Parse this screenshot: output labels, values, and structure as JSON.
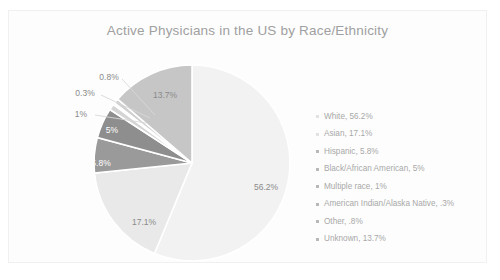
{
  "chart_data": {
    "type": "pie",
    "title": "Active Physicians in the US by Race/Ethnicity",
    "categories": [
      "White",
      "Asian",
      "Hispanic",
      "Black/African American",
      "Multiple race",
      "American Indian/Alaska Native",
      "Other",
      "Unknown"
    ],
    "values": [
      56.2,
      17.1,
      5.8,
      5,
      1,
      0.3,
      0.8,
      13.7
    ],
    "value_labels": [
      "56.2%",
      "17.1%",
      "5.8%",
      "5%",
      "1%",
      "0.3%",
      "0.8%",
      "13.7%"
    ],
    "legend_position": "right",
    "legend_entries": [
      "White, 56.2%",
      "Asian, 17.1%",
      "Hispanic, 5.8%",
      "Black/African American, 5%",
      "Multiple race, 1%",
      "American Indian/Alaska Native, .3%",
      "Other, .8%",
      "Unknown, 13.7%"
    ],
    "slice_colors": [
      "#f2f2f2",
      "#e9e9e9",
      "#9a9a9a",
      "#8e8e8e",
      "#d5d5d5",
      "#bdbdbd",
      "#cfcfcf",
      "#c6c6c6"
    ],
    "xlabel": "",
    "ylabel": "",
    "grid": false
  },
  "card": {
    "title": "Active Physicians in the US by Race/Ethnicity"
  },
  "pie_labels": [
    {
      "text": "13.7%",
      "x": 156,
      "y": 84,
      "style": "dark-text"
    },
    {
      "text": "0.8%",
      "x": 100,
      "y": 66,
      "style": "callout-text"
    },
    {
      "text": "0.3%",
      "x": 76,
      "y": 82,
      "style": "callout-text"
    },
    {
      "text": "1%",
      "x": 72,
      "y": 103,
      "style": "callout-text"
    },
    {
      "text": "5%",
      "x": 103,
      "y": 119,
      "style": "light-text"
    },
    {
      "text": "5.8%",
      "x": 92,
      "y": 152,
      "style": "light-text"
    },
    {
      "text": "17.1%",
      "x": 135,
      "y": 211,
      "style": "dark-text"
    },
    {
      "text": "56.2%",
      "x": 257,
      "y": 176,
      "style": "dark-text"
    }
  ],
  "legend": {
    "items": [
      {
        "label": "White, 56.2%",
        "marker": "faint"
      },
      {
        "label": "Asian, 17.1%",
        "marker": "faint"
      },
      {
        "label": "Hispanic, 5.8%",
        "marker": "normal"
      },
      {
        "label": "Black/African American, 5%",
        "marker": "normal"
      },
      {
        "label": "Multiple race, 1%",
        "marker": "normal"
      },
      {
        "label": "American Indian/Alaska Native, .3%",
        "marker": "normal"
      },
      {
        "label": "Other, .8%",
        "marker": "normal"
      },
      {
        "label": "Unknown, 13.7%",
        "marker": "normal"
      }
    ]
  }
}
